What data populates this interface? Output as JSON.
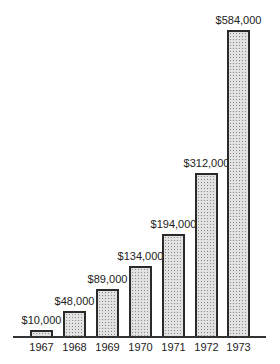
{
  "chart_data": {
    "type": "bar",
    "title": "",
    "xlabel": "",
    "ylabel": "",
    "categories": [
      "1967",
      "1968",
      "1969",
      "1970",
      "1971",
      "1972",
      "1973"
    ],
    "values": [
      10000,
      48000,
      89000,
      134000,
      194000,
      312000,
      584000
    ],
    "value_labels": [
      "$10,000",
      "$48,000",
      "$89,000",
      "$134,000",
      "$194,000",
      "$312,000",
      "$584,000"
    ],
    "ylim": [
      0,
      584000
    ],
    "grid": false,
    "legend": null,
    "colors": {
      "bar_fill": "#e2e2e2",
      "bar_stipple": "#8a8a8a",
      "bar_border": "#2a2a2a",
      "text": "#222222"
    }
  }
}
